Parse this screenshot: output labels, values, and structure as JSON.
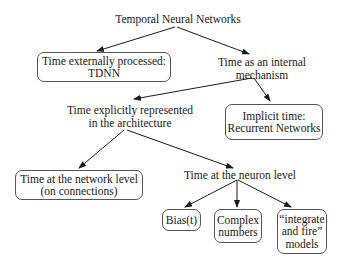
{
  "title": "Temporal Neural Networks",
  "nodes": {
    "root": {
      "lines": [
        "Temporal Neural Networks"
      ]
    },
    "external": {
      "lines": [
        "Time externally processed:",
        "TDNN"
      ]
    },
    "internal": {
      "lines": [
        "Time as an internal",
        "mechanism"
      ]
    },
    "explicit": {
      "lines": [
        "Time explicitly represented",
        "in the architecture"
      ]
    },
    "implicit": {
      "lines": [
        "Implicit time:",
        "Recurrent Networks"
      ]
    },
    "network_level": {
      "lines": [
        "Time at the network level",
        "(on connections)"
      ]
    },
    "neuron_level": {
      "lines": [
        "Time at the neuron level"
      ]
    },
    "bias": {
      "lines": [
        "Bias(t)"
      ]
    },
    "complex": {
      "lines": [
        "Complex",
        "numbers"
      ]
    },
    "integrate": {
      "lines": [
        "“integrate",
        "and fire”",
        "models"
      ]
    }
  },
  "edges": [
    {
      "from": "root",
      "to": "external"
    },
    {
      "from": "root",
      "to": "internal"
    },
    {
      "from": "internal",
      "to": "explicit"
    },
    {
      "from": "internal",
      "to": "implicit"
    },
    {
      "from": "explicit",
      "to": "network_level"
    },
    {
      "from": "explicit",
      "to": "neuron_level"
    },
    {
      "from": "neuron_level",
      "to": "bias"
    },
    {
      "from": "neuron_level",
      "to": "complex"
    },
    {
      "from": "neuron_level",
      "to": "integrate"
    }
  ],
  "colors": {
    "line": "#1a1a1a",
    "box_border": "#555555",
    "background": "#ffffff"
  }
}
